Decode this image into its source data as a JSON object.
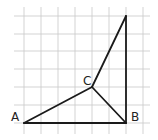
{
  "diagram": {
    "type": "geometry-figure-on-grid",
    "grid": {
      "vertical_x": [
        24,
        41,
        58,
        75,
        92,
        109,
        126,
        143
      ],
      "horizontal_y": [
        16,
        34,
        51,
        69,
        87,
        105,
        123
      ],
      "extent": {
        "x1": 14,
        "x2": 150,
        "y1": 7,
        "y2": 134
      },
      "color": "#c8c8c8"
    },
    "points": {
      "A": {
        "label": "A",
        "x": 24,
        "y": 123,
        "label_x": 11,
        "label_y": 121
      },
      "B": {
        "label": "B",
        "x": 126,
        "y": 123,
        "label_x": 131,
        "label_y": 121
      },
      "C": {
        "label": "C",
        "x": 92,
        "y": 87,
        "label_x": 83,
        "label_y": 85
      },
      "T": {
        "label": "",
        "x": 126,
        "y": 16
      }
    },
    "edges": [
      [
        "A",
        "B"
      ],
      [
        "A",
        "C"
      ],
      [
        "C",
        "B"
      ],
      [
        "C",
        "T"
      ],
      [
        "T",
        "B"
      ]
    ],
    "edge_color": "#1a1a1a"
  }
}
